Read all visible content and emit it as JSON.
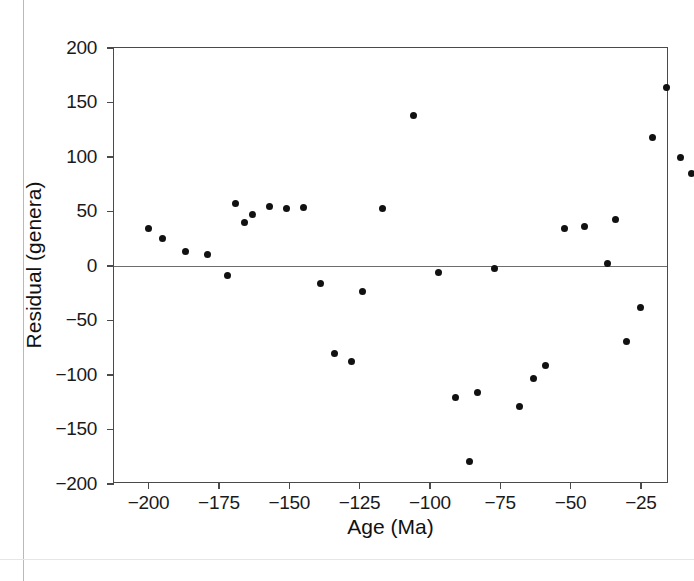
{
  "figure": {
    "caption_present": false
  },
  "chart_data": {
    "type": "scatter",
    "title": "",
    "xlabel": "Age (Ma)",
    "ylabel": "Residual (genera)",
    "xlim": [
      -212.3,
      -15.0
    ],
    "ylim": [
      -200,
      200
    ],
    "xticks": [
      -200,
      -175,
      -150,
      -125,
      -100,
      -75,
      -50,
      -25
    ],
    "xticklabels": [
      "−200",
      "−175",
      "−150",
      "−125",
      "−100",
      "−75",
      "−50",
      "−25"
    ],
    "yticks": [
      200,
      150,
      100,
      50,
      0,
      -50,
      -100,
      -150,
      -200
    ],
    "yticklabels": [
      "200",
      "150",
      "100",
      "50",
      "0",
      "−50",
      "−100",
      "−150",
      "−200"
    ],
    "grid": false,
    "legend": null,
    "reference_lines": [
      {
        "orientation": "horizontal",
        "value": 0,
        "color": "#6e6e6e"
      }
    ],
    "marker": {
      "shape": "circle",
      "color": "#111111",
      "size": 7
    },
    "series": [
      {
        "name": "Residual (genera)",
        "points": [
          {
            "x": -200,
            "y": 34
          },
          {
            "x": -195,
            "y": 25
          },
          {
            "x": -187,
            "y": 13
          },
          {
            "x": -179,
            "y": 11
          },
          {
            "x": -172,
            "y": -9
          },
          {
            "x": -169,
            "y": 57
          },
          {
            "x": -166,
            "y": 40
          },
          {
            "x": -163,
            "y": 47
          },
          {
            "x": -157,
            "y": 55
          },
          {
            "x": -151,
            "y": 53
          },
          {
            "x": -145,
            "y": 54
          },
          {
            "x": -139,
            "y": -16
          },
          {
            "x": -134,
            "y": -80
          },
          {
            "x": -128,
            "y": -88
          },
          {
            "x": -124,
            "y": -23
          },
          {
            "x": -117,
            "y": 53
          },
          {
            "x": -106,
            "y": 138
          },
          {
            "x": -97,
            "y": -6
          },
          {
            "x": -91,
            "y": -121
          },
          {
            "x": -86,
            "y": -179
          },
          {
            "x": -83,
            "y": -116
          },
          {
            "x": -77,
            "y": -2
          },
          {
            "x": -68,
            "y": -129
          },
          {
            "x": -63,
            "y": -103
          },
          {
            "x": -59,
            "y": -91
          },
          {
            "x": -52,
            "y": 34
          },
          {
            "x": -45,
            "y": 36
          },
          {
            "x": -37,
            "y": 2
          },
          {
            "x": -34,
            "y": 43
          },
          {
            "x": -30,
            "y": -69
          },
          {
            "x": -25,
            "y": -38
          },
          {
            "x": -21,
            "y": 118
          },
          {
            "x": -16,
            "y": 164
          },
          {
            "x": -11,
            "y": 100
          },
          {
            "x": -7,
            "y": 85
          }
        ]
      }
    ]
  }
}
